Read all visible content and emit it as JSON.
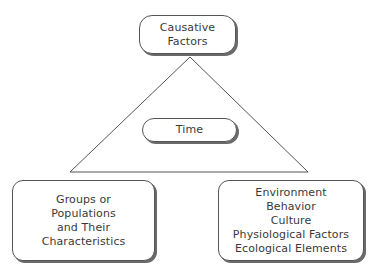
{
  "diagram": {
    "type": "epidemiological-triangle",
    "apex": {
      "label_lines": [
        "Causative",
        "Factors"
      ]
    },
    "center": {
      "label_lines": [
        "Time"
      ]
    },
    "bottom_left": {
      "label_lines": [
        "Groups or",
        "Populations",
        "and Their",
        "Characteristics"
      ]
    },
    "bottom_right": {
      "label_lines": [
        "Environment",
        "Behavior",
        "Culture",
        "Physiological Factors",
        "Ecological Elements"
      ]
    },
    "triangle": {
      "apex": [
        190,
        57
      ],
      "bottom_left": [
        70,
        172
      ],
      "bottom_right": [
        308,
        172
      ],
      "stroke": "#555555"
    },
    "colors": {
      "border": "#555555",
      "shadow": "#6a6a6a",
      "text": "#3a3a3a",
      "background": "#ffffff"
    }
  }
}
